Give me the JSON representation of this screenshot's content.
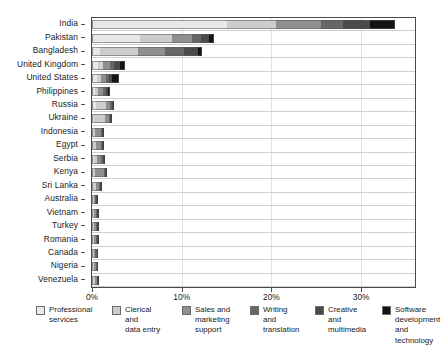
{
  "chart_data": {
    "type": "bar",
    "orientation": "horizontal",
    "stacked": true,
    "title": "",
    "subtitle": "",
    "xlabel": "",
    "ylabel": "",
    "xlim": [
      0,
      36
    ],
    "xticks": [
      0,
      10,
      20,
      30
    ],
    "xtick_labels": [
      "0%",
      "10%",
      "20%",
      "30%"
    ],
    "grid": true,
    "legend_position": "bottom",
    "categories": [
      "India",
      "Pakistan",
      "Bangladesh",
      "United Kingdom",
      "United States",
      "Philippines",
      "Russia",
      "Ukraine",
      "Indonesia",
      "Egypt",
      "Serbia",
      "Kenya",
      "Sri Lanka",
      "Australia",
      "Vietnam",
      "Turkey",
      "Romania",
      "Canada",
      "Nigeria",
      "Venezuela"
    ],
    "series": [
      {
        "name": "Professional services",
        "color": "#e8e8e8",
        "values": [
          15.0,
          5.4,
          0.9,
          0.7,
          0.6,
          0.3,
          0.5,
          0.2,
          0.1,
          0.15,
          0.25,
          0.1,
          0.1,
          0.15,
          0.1,
          0.1,
          0.1,
          0.1,
          0.05,
          0.1
        ]
      },
      {
        "name": "Clerical and data entry",
        "color": "#cdcdcd",
        "values": [
          5.5,
          3.5,
          4.2,
          0.5,
          0.4,
          0.35,
          1.1,
          1.3,
          0.25,
          0.3,
          0.35,
          0.25,
          0.3,
          0.1,
          0.15,
          0.15,
          0.1,
          0.1,
          0.1,
          0.2
        ]
      },
      {
        "name": "Sales and marketing support",
        "color": "#8f8f8f",
        "values": [
          5.0,
          2.2,
          3.0,
          0.8,
          0.6,
          0.55,
          0.4,
          0.35,
          0.65,
          0.5,
          0.45,
          0.95,
          0.4,
          0.1,
          0.2,
          0.2,
          0.25,
          0.15,
          0.2,
          0.2
        ]
      },
      {
        "name": "Writing and translation",
        "color": "#666666",
        "values": [
          2.5,
          1.0,
          2.2,
          0.5,
          0.3,
          0.35,
          0.2,
          0.2,
          0.1,
          0.15,
          0.15,
          0.15,
          0.1,
          0.1,
          0.1,
          0.15,
          0.15,
          0.15,
          0.1,
          0.1
        ]
      },
      {
        "name": "Creative and multimedia",
        "color": "#4a4a4a",
        "values": [
          3.0,
          0.9,
          1.5,
          0.6,
          0.35,
          0.25,
          0.15,
          0.1,
          0.1,
          0.1,
          0.1,
          0.1,
          0.1,
          0.1,
          0.1,
          0.1,
          0.1,
          0.1,
          0.1,
          0.05
        ]
      },
      {
        "name": "Software development and technology",
        "color": "#141414",
        "values": [
          2.8,
          0.6,
          0.5,
          0.6,
          0.75,
          0.2,
          0.1,
          0.05,
          0.05,
          0.05,
          0.05,
          0.05,
          0.05,
          0.05,
          0.05,
          0.05,
          0.05,
          0.05,
          0.05,
          0.05
        ]
      }
    ],
    "totals": [
      33.8,
      13.6,
      12.3,
      3.7,
      3.0,
      2.0,
      2.45,
      2.2,
      1.25,
      1.25,
      1.35,
      1.6,
      1.05,
      0.6,
      0.7,
      0.75,
      0.75,
      0.65,
      0.6,
      0.7
    ]
  },
  "legend": {
    "items": [
      {
        "label": "Professional\nservices",
        "color": "#e8e8e8"
      },
      {
        "label": "Clerical\nand\ndata entry",
        "color": "#cdcdcd"
      },
      {
        "label": "Sales and\nmarketing\nsupport",
        "color": "#8f8f8f"
      },
      {
        "label": "Writing\nand\ntranslation",
        "color": "#666666"
      },
      {
        "label": "Creative\nand\nmultimedia",
        "color": "#4a4a4a"
      },
      {
        "label": "Software\ndevelopment\nand technology",
        "color": "#141414"
      }
    ]
  }
}
